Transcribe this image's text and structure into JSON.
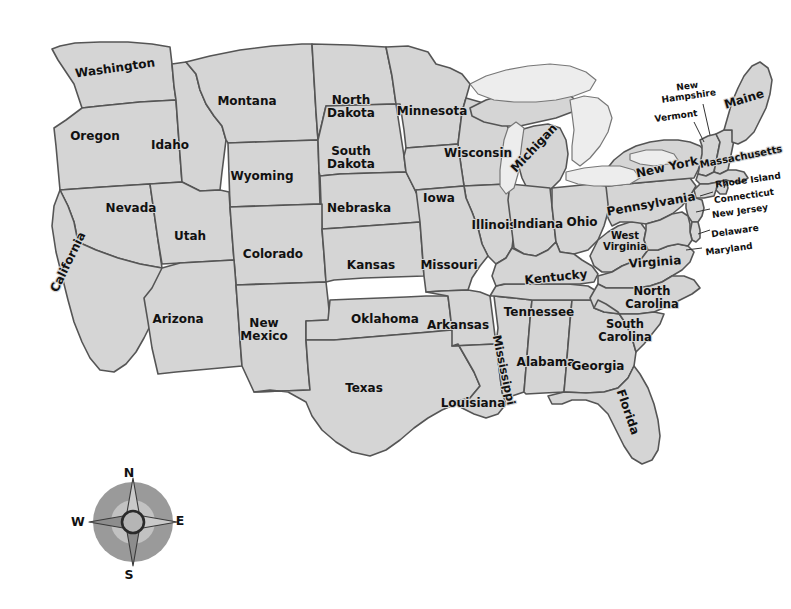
{
  "map": {
    "title": "United States Map",
    "colors": {
      "background": "#ffffff",
      "land_fill": "#d5d5d5",
      "land_stroke": "#555555",
      "lake_fill": "#ededed",
      "outer_border": "#333333",
      "label_text": "#111111",
      "compass_disc": "#9a9a9a",
      "compass_ring": "#2a2a2a"
    },
    "projection_note": "contiguous 48 states, Albers-like",
    "states": [
      {
        "id": "washington",
        "label": "Washington",
        "x": 115,
        "y": 68,
        "rot": -8,
        "size": "lbl-lg",
        "lines": [
          "Washington"
        ]
      },
      {
        "id": "oregon",
        "label": "Oregon",
        "x": 95,
        "y": 136,
        "rot": 0,
        "size": "lbl-lg",
        "lines": [
          "Oregon"
        ]
      },
      {
        "id": "idaho",
        "label": "Idaho",
        "x": 170,
        "y": 145,
        "rot": 0,
        "size": "lbl-lg",
        "lines": [
          "Idaho"
        ]
      },
      {
        "id": "montana",
        "label": "Montana",
        "x": 247,
        "y": 101,
        "rot": 0,
        "size": "lbl-lg",
        "lines": [
          "Montana"
        ]
      },
      {
        "id": "wyoming",
        "label": "Wyoming",
        "x": 262,
        "y": 176,
        "rot": 0,
        "size": "lbl-lg",
        "lines": [
          "Wyoming"
        ]
      },
      {
        "id": "north-dakota",
        "label": "North Dakota",
        "x": 351,
        "y": 106,
        "rot": 0,
        "size": "lbl-lg",
        "lines": [
          "North",
          "Dakota"
        ]
      },
      {
        "id": "south-dakota",
        "label": "South Dakota",
        "x": 351,
        "y": 157,
        "rot": 0,
        "size": "lbl-lg",
        "lines": [
          "South",
          "Dakota"
        ]
      },
      {
        "id": "nebraska",
        "label": "Nebraska",
        "x": 359,
        "y": 208,
        "rot": 0,
        "size": "lbl-lg",
        "lines": [
          "Nebraska"
        ]
      },
      {
        "id": "minnesota",
        "label": "Minnesota",
        "x": 432,
        "y": 111,
        "rot": 0,
        "size": "lbl-lg",
        "lines": [
          "Minnesota"
        ]
      },
      {
        "id": "wisconsin",
        "label": "Wisconsin",
        "x": 478,
        "y": 153,
        "rot": 0,
        "size": "lbl-lg",
        "lines": [
          "Wisconsin"
        ]
      },
      {
        "id": "michigan",
        "label": "Michigan",
        "x": 534,
        "y": 148,
        "rot": -47,
        "size": "lbl-lg",
        "lines": [
          "Michigan"
        ]
      },
      {
        "id": "iowa",
        "label": "Iowa",
        "x": 439,
        "y": 198,
        "rot": 0,
        "size": "lbl-lg",
        "lines": [
          "Iowa"
        ]
      },
      {
        "id": "illinois",
        "label": "Illinois",
        "x": 494,
        "y": 225,
        "rot": 0,
        "size": "lbl-lg",
        "lines": [
          "Illinois"
        ]
      },
      {
        "id": "indiana",
        "label": "Indiana",
        "x": 538,
        "y": 224,
        "rot": 0,
        "size": "lbl-lg",
        "lines": [
          "Indiana"
        ]
      },
      {
        "id": "ohio",
        "label": "Ohio",
        "x": 582,
        "y": 222,
        "rot": 0,
        "size": "lbl-lg",
        "lines": [
          "Ohio"
        ]
      },
      {
        "id": "nevada",
        "label": "Nevada",
        "x": 131,
        "y": 208,
        "rot": 0,
        "size": "lbl-lg",
        "lines": [
          "Nevada"
        ]
      },
      {
        "id": "utah",
        "label": "Utah",
        "x": 190,
        "y": 236,
        "rot": 0,
        "size": "lbl-lg",
        "lines": [
          "Utah"
        ]
      },
      {
        "id": "colorado",
        "label": "Colorado",
        "x": 273,
        "y": 254,
        "rot": 0,
        "size": "lbl-lg",
        "lines": [
          "Colorado"
        ]
      },
      {
        "id": "kansas",
        "label": "Kansas",
        "x": 371,
        "y": 265,
        "rot": 0,
        "size": "lbl-lg",
        "lines": [
          "Kansas"
        ]
      },
      {
        "id": "missouri",
        "label": "Missouri",
        "x": 449,
        "y": 265,
        "rot": 0,
        "size": "lbl-lg",
        "lines": [
          "Missouri"
        ]
      },
      {
        "id": "california",
        "label": "California",
        "x": 68,
        "y": 262,
        "rot": -64,
        "size": "lbl-lg",
        "lines": [
          "California"
        ]
      },
      {
        "id": "arizona",
        "label": "Arizona",
        "x": 178,
        "y": 319,
        "rot": 0,
        "size": "lbl-lg",
        "lines": [
          "Arizona"
        ]
      },
      {
        "id": "new-mexico",
        "label": "New Mexico",
        "x": 264,
        "y": 329,
        "rot": 0,
        "size": "lbl-lg",
        "lines": [
          "New",
          "Mexico"
        ]
      },
      {
        "id": "oklahoma",
        "label": "Oklahoma",
        "x": 385,
        "y": 319,
        "rot": 0,
        "size": "lbl-lg",
        "lines": [
          "Oklahoma"
        ]
      },
      {
        "id": "texas",
        "label": "Texas",
        "x": 364,
        "y": 388,
        "rot": 0,
        "size": "lbl-lg",
        "lines": [
          "Texas"
        ]
      },
      {
        "id": "arkansas",
        "label": "Arkansas",
        "x": 458,
        "y": 325,
        "rot": 0,
        "size": "lbl-lg",
        "lines": [
          "Arkansas"
        ]
      },
      {
        "id": "louisiana",
        "label": "Louisiana",
        "x": 473,
        "y": 403,
        "rot": 0,
        "size": "lbl-lg",
        "lines": [
          "Louisiana"
        ]
      },
      {
        "id": "mississippi",
        "label": "Mississippi",
        "x": 504,
        "y": 370,
        "rot": 78,
        "size": "lbl-md",
        "lines": [
          "Mississippi"
        ]
      },
      {
        "id": "alabama",
        "label": "Alabama",
        "x": 546,
        "y": 362,
        "rot": 0,
        "size": "lbl-lg",
        "lines": [
          "Alabama"
        ]
      },
      {
        "id": "georgia",
        "label": "Georgia",
        "x": 598,
        "y": 366,
        "rot": 0,
        "size": "lbl-lg",
        "lines": [
          "Georgia"
        ]
      },
      {
        "id": "florida",
        "label": "Florida",
        "x": 628,
        "y": 412,
        "rot": 71,
        "size": "lbl-lg",
        "lines": [
          "Florida"
        ]
      },
      {
        "id": "tennessee",
        "label": "Tennessee",
        "x": 539,
        "y": 312,
        "rot": 0,
        "size": "lbl-lg",
        "lines": [
          "Tennessee"
        ]
      },
      {
        "id": "kentucky",
        "label": "Kentucky",
        "x": 556,
        "y": 277,
        "rot": -6,
        "size": "lbl-lg",
        "lines": [
          "Kentucky"
        ]
      },
      {
        "id": "west-virginia",
        "label": "West Virginia",
        "x": 625,
        "y": 241,
        "rot": 0,
        "size": "lbl-sm",
        "lines": [
          "West",
          "Virginia"
        ]
      },
      {
        "id": "virginia",
        "label": "Virginia",
        "x": 655,
        "y": 262,
        "rot": -4,
        "size": "lbl-lg",
        "lines": [
          "Virginia"
        ]
      },
      {
        "id": "north-carolina",
        "label": "North Carolina",
        "x": 652,
        "y": 297,
        "rot": 0,
        "size": "lbl-md",
        "lines": [
          "North",
          "Carolina"
        ]
      },
      {
        "id": "south-carolina",
        "label": "South Carolina",
        "x": 625,
        "y": 330,
        "rot": 0,
        "size": "lbl-md",
        "lines": [
          "South",
          "Carolina"
        ]
      },
      {
        "id": "pennsylvania",
        "label": "Pennsylvania",
        "x": 651,
        "y": 204,
        "rot": -10,
        "size": "lbl-lg",
        "lines": [
          "Pennsylvania"
        ]
      },
      {
        "id": "new-york",
        "label": "New York",
        "x": 667,
        "y": 167,
        "rot": -12,
        "size": "lbl-lg",
        "lines": [
          "New York"
        ]
      },
      {
        "id": "maine",
        "label": "Maine",
        "x": 744,
        "y": 99,
        "rot": -17,
        "size": "lbl-lg",
        "lines": [
          "Maine"
        ]
      },
      {
        "id": "massachusetts",
        "label": "Massachusetts",
        "x": 741,
        "y": 157,
        "rot": -11,
        "size": "lbl-sm",
        "lines": [
          "Massachusetts"
        ]
      }
    ],
    "callout_labels": [
      {
        "id": "new-hampshire",
        "label": "New Hampshire",
        "x": 688,
        "y": 91,
        "rot": -8,
        "size": "lbl-xs",
        "lines": [
          "New",
          "Hampshire"
        ],
        "leader": "M 703,104 L 710,135"
      },
      {
        "id": "vermont",
        "label": "Vermont",
        "x": 676,
        "y": 116,
        "rot": -8,
        "size": "lbl-xs",
        "lines": [
          "Vermont"
        ],
        "leader": "M 694,120 L 702,140"
      },
      {
        "id": "rhode-island",
        "label": "Rhode Island",
        "x": 748,
        "y": 180,
        "rot": -8,
        "size": "lbl-xs",
        "lines": [
          "Rhode Island"
        ],
        "leader": "M 712,180 L 724,173"
      },
      {
        "id": "connecticut",
        "label": "Connecticut",
        "x": 744,
        "y": 196,
        "rot": -8,
        "size": "lbl-xs",
        "lines": [
          "Connecticut"
        ],
        "leader": "M 703,188 L 718,192"
      },
      {
        "id": "new-jersey",
        "label": "New Jersey",
        "x": 740,
        "y": 211,
        "rot": -8,
        "size": "lbl-xs",
        "lines": [
          "New Jersey"
        ],
        "leader": "M 701,206 L 714,209"
      },
      {
        "id": "delaware",
        "label": "Delaware",
        "x": 735,
        "y": 231,
        "rot": -8,
        "size": "lbl-xs",
        "lines": [
          "Delaware"
        ],
        "leader": "M 700,226 L 712,229"
      },
      {
        "id": "maryland",
        "label": "Maryland",
        "x": 729,
        "y": 249,
        "rot": -8,
        "size": "lbl-xs",
        "lines": [
          "Maryland"
        ],
        "leader": "M 691,245 L 706,247"
      }
    ],
    "great_lakes": [
      {
        "id": "lake-superior"
      },
      {
        "id": "lake-michigan"
      },
      {
        "id": "lake-huron"
      },
      {
        "id": "lake-erie"
      },
      {
        "id": "lake-ontario"
      }
    ]
  },
  "compass": {
    "name": "compass-rose",
    "cx": 133,
    "cy": 522,
    "radius": 40,
    "north": "N",
    "east": "E",
    "south": "S",
    "west": "W"
  }
}
